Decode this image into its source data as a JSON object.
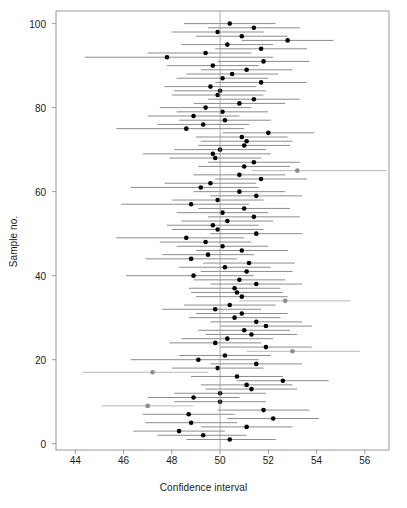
{
  "chart_data": {
    "type": "scatter",
    "title": "",
    "xlabel": "Confidence interval",
    "ylabel": "Sample no.",
    "xlim": [
      43.2,
      57.0
    ],
    "ylim": [
      -1.5,
      103
    ],
    "grid": false,
    "legend": null,
    "xticks": [
      44,
      46,
      48,
      50,
      52,
      54,
      56
    ],
    "yticks": [
      0,
      20,
      40,
      60,
      80,
      100
    ],
    "reference_line": {
      "x": 50,
      "orientation": "vertical",
      "color": "#999999"
    },
    "colors": {
      "covering": "#000000",
      "non_covering": "#8c8c8c",
      "interval_line": "#808080",
      "frame": "#999999"
    },
    "series": [
      {
        "name": "Confidence intervals",
        "x_label": "mean",
        "lo_label": "lower",
        "hi_label": "upper"
      }
    ],
    "points": [
      {
        "sample": 1,
        "mean": 50.4,
        "lo": 48.6,
        "hi": 52.3,
        "covers": true
      },
      {
        "sample": 2,
        "mean": 49.3,
        "lo": 47.4,
        "hi": 51.1,
        "covers": true
      },
      {
        "sample": 3,
        "mean": 48.3,
        "lo": 46.4,
        "hi": 50.2,
        "covers": true
      },
      {
        "sample": 4,
        "mean": 51.1,
        "lo": 49.2,
        "hi": 53.0,
        "covers": true
      },
      {
        "sample": 5,
        "mean": 48.8,
        "lo": 46.9,
        "hi": 50.7,
        "covers": true
      },
      {
        "sample": 6,
        "mean": 52.2,
        "lo": 50.3,
        "hi": 54.1,
        "covers": true
      },
      {
        "sample": 7,
        "mean": 48.7,
        "lo": 46.8,
        "hi": 50.6,
        "covers": true
      },
      {
        "sample": 8,
        "mean": 51.8,
        "lo": 49.9,
        "hi": 53.7,
        "covers": true
      },
      {
        "sample": 9,
        "mean": 47.0,
        "lo": 45.1,
        "hi": 48.9,
        "covers": false
      },
      {
        "sample": 10,
        "mean": 50.0,
        "lo": 48.1,
        "hi": 51.9,
        "covers": true
      },
      {
        "sample": 11,
        "mean": 48.9,
        "lo": 47.0,
        "hi": 50.8,
        "covers": true
      },
      {
        "sample": 12,
        "mean": 50.0,
        "lo": 48.1,
        "hi": 51.9,
        "covers": true
      },
      {
        "sample": 13,
        "mean": 51.3,
        "lo": 49.4,
        "hi": 53.2,
        "covers": true
      },
      {
        "sample": 14,
        "mean": 51.1,
        "lo": 49.2,
        "hi": 53.0,
        "covers": true
      },
      {
        "sample": 15,
        "mean": 52.6,
        "lo": 50.7,
        "hi": 54.5,
        "covers": true
      },
      {
        "sample": 16,
        "mean": 50.7,
        "lo": 48.8,
        "hi": 52.6,
        "covers": true
      },
      {
        "sample": 17,
        "mean": 47.2,
        "lo": 44.3,
        "hi": 49.5,
        "covers": false
      },
      {
        "sample": 18,
        "mean": 49.9,
        "lo": 48.0,
        "hi": 51.8,
        "covers": true
      },
      {
        "sample": 19,
        "mean": 51.5,
        "lo": 49.6,
        "hi": 53.4,
        "covers": true
      },
      {
        "sample": 20,
        "mean": 49.1,
        "lo": 46.3,
        "hi": 51.6,
        "covers": true
      },
      {
        "sample": 21,
        "mean": 50.2,
        "lo": 48.3,
        "hi": 52.1,
        "covers": true
      },
      {
        "sample": 22,
        "mean": 53.0,
        "lo": 51.1,
        "hi": 55.8,
        "covers": false
      },
      {
        "sample": 23,
        "mean": 51.9,
        "lo": 50.0,
        "hi": 53.8,
        "covers": true
      },
      {
        "sample": 24,
        "mean": 49.8,
        "lo": 47.9,
        "hi": 51.7,
        "covers": true
      },
      {
        "sample": 25,
        "mean": 50.3,
        "lo": 48.4,
        "hi": 52.2,
        "covers": true
      },
      {
        "sample": 26,
        "mean": 51.3,
        "lo": 49.4,
        "hi": 53.2,
        "covers": true
      },
      {
        "sample": 27,
        "mean": 51.0,
        "lo": 49.1,
        "hi": 52.9,
        "covers": true
      },
      {
        "sample": 28,
        "mean": 51.9,
        "lo": 50.0,
        "hi": 53.8,
        "covers": true
      },
      {
        "sample": 29,
        "mean": 51.5,
        "lo": 49.6,
        "hi": 53.4,
        "covers": true
      },
      {
        "sample": 30,
        "mean": 50.6,
        "lo": 48.7,
        "hi": 52.5,
        "covers": true
      },
      {
        "sample": 31,
        "mean": 50.9,
        "lo": 49.0,
        "hi": 52.8,
        "covers": true
      },
      {
        "sample": 32,
        "mean": 49.8,
        "lo": 47.6,
        "hi": 51.7,
        "covers": true
      },
      {
        "sample": 33,
        "mean": 50.4,
        "lo": 48.5,
        "hi": 52.3,
        "covers": true
      },
      {
        "sample": 34,
        "mean": 52.7,
        "lo": 50.8,
        "hi": 55.4,
        "covers": false
      },
      {
        "sample": 35,
        "mean": 50.9,
        "lo": 49.0,
        "hi": 52.8,
        "covers": true
      },
      {
        "sample": 36,
        "mean": 50.7,
        "lo": 48.8,
        "hi": 52.6,
        "covers": true
      },
      {
        "sample": 37,
        "mean": 50.6,
        "lo": 48.7,
        "hi": 52.5,
        "covers": true
      },
      {
        "sample": 38,
        "mean": 51.5,
        "lo": 49.6,
        "hi": 53.4,
        "covers": true
      },
      {
        "sample": 39,
        "mean": 50.8,
        "lo": 48.9,
        "hi": 52.7,
        "covers": true
      },
      {
        "sample": 40,
        "mean": 48.9,
        "lo": 46.1,
        "hi": 51.4,
        "covers": true
      },
      {
        "sample": 41,
        "mean": 51.1,
        "lo": 49.2,
        "hi": 53.0,
        "covers": true
      },
      {
        "sample": 42,
        "mean": 50.2,
        "lo": 48.3,
        "hi": 52.1,
        "covers": true
      },
      {
        "sample": 43,
        "mean": 51.2,
        "lo": 49.3,
        "hi": 53.1,
        "covers": true
      },
      {
        "sample": 44,
        "mean": 48.8,
        "lo": 46.9,
        "hi": 50.7,
        "covers": true
      },
      {
        "sample": 45,
        "mean": 49.5,
        "lo": 47.6,
        "hi": 51.4,
        "covers": true
      },
      {
        "sample": 46,
        "mean": 50.9,
        "lo": 49.0,
        "hi": 52.8,
        "covers": true
      },
      {
        "sample": 47,
        "mean": 50.1,
        "lo": 48.2,
        "hi": 52.0,
        "covers": true
      },
      {
        "sample": 48,
        "mean": 49.4,
        "lo": 47.5,
        "hi": 51.3,
        "covers": true
      },
      {
        "sample": 49,
        "mean": 48.6,
        "lo": 45.7,
        "hi": 51.0,
        "covers": true
      },
      {
        "sample": 50,
        "mean": 51.5,
        "lo": 49.6,
        "hi": 53.4,
        "covers": true
      },
      {
        "sample": 51,
        "mean": 49.9,
        "lo": 48.0,
        "hi": 51.8,
        "covers": true
      },
      {
        "sample": 52,
        "mean": 49.7,
        "lo": 47.8,
        "hi": 51.6,
        "covers": true
      },
      {
        "sample": 53,
        "mean": 50.3,
        "lo": 48.4,
        "hi": 52.2,
        "covers": true
      },
      {
        "sample": 54,
        "mean": 51.4,
        "lo": 49.5,
        "hi": 53.3,
        "covers": true
      },
      {
        "sample": 55,
        "mean": 50.1,
        "lo": 48.2,
        "hi": 52.0,
        "covers": true
      },
      {
        "sample": 56,
        "mean": 51.0,
        "lo": 49.1,
        "hi": 52.9,
        "covers": true
      },
      {
        "sample": 57,
        "mean": 48.8,
        "lo": 45.9,
        "hi": 51.2,
        "covers": true
      },
      {
        "sample": 58,
        "mean": 49.9,
        "lo": 48.0,
        "hi": 51.8,
        "covers": true
      },
      {
        "sample": 59,
        "mean": 51.5,
        "lo": 49.6,
        "hi": 53.4,
        "covers": true
      },
      {
        "sample": 60,
        "mean": 50.8,
        "lo": 48.9,
        "hi": 52.7,
        "covers": true
      },
      {
        "sample": 61,
        "mean": 49.2,
        "lo": 46.3,
        "hi": 51.6,
        "covers": true
      },
      {
        "sample": 62,
        "mean": 49.6,
        "lo": 47.7,
        "hi": 51.5,
        "covers": true
      },
      {
        "sample": 63,
        "mean": 51.7,
        "lo": 49.8,
        "hi": 53.6,
        "covers": true
      },
      {
        "sample": 64,
        "mean": 50.8,
        "lo": 48.9,
        "hi": 52.7,
        "covers": true
      },
      {
        "sample": 65,
        "mean": 53.2,
        "lo": 51.3,
        "hi": 56.9,
        "covers": false
      },
      {
        "sample": 66,
        "mean": 51.0,
        "lo": 49.1,
        "hi": 52.9,
        "covers": true
      },
      {
        "sample": 67,
        "mean": 51.4,
        "lo": 49.5,
        "hi": 53.3,
        "covers": true
      },
      {
        "sample": 68,
        "mean": 49.8,
        "lo": 47.9,
        "hi": 51.7,
        "covers": true
      },
      {
        "sample": 69,
        "mean": 49.7,
        "lo": 46.8,
        "hi": 52.1,
        "covers": true
      },
      {
        "sample": 70,
        "mean": 50.0,
        "lo": 48.1,
        "hi": 51.9,
        "covers": true
      },
      {
        "sample": 71,
        "mean": 51.0,
        "lo": 49.1,
        "hi": 52.9,
        "covers": true
      },
      {
        "sample": 72,
        "mean": 51.1,
        "lo": 49.2,
        "hi": 53.0,
        "covers": true
      },
      {
        "sample": 73,
        "mean": 50.9,
        "lo": 49.0,
        "hi": 52.8,
        "covers": true
      },
      {
        "sample": 74,
        "mean": 52.0,
        "lo": 50.1,
        "hi": 53.9,
        "covers": true
      },
      {
        "sample": 75,
        "mean": 48.6,
        "lo": 45.7,
        "hi": 51.0,
        "covers": true
      },
      {
        "sample": 76,
        "mean": 49.3,
        "lo": 47.4,
        "hi": 51.2,
        "covers": true
      },
      {
        "sample": 77,
        "mean": 50.2,
        "lo": 48.3,
        "hi": 52.1,
        "covers": true
      },
      {
        "sample": 78,
        "mean": 48.9,
        "lo": 47.0,
        "hi": 50.8,
        "covers": true
      },
      {
        "sample": 79,
        "mean": 50.1,
        "lo": 48.2,
        "hi": 52.0,
        "covers": true
      },
      {
        "sample": 80,
        "mean": 49.4,
        "lo": 47.5,
        "hi": 51.3,
        "covers": true
      },
      {
        "sample": 81,
        "mean": 50.8,
        "lo": 48.9,
        "hi": 52.7,
        "covers": true
      },
      {
        "sample": 82,
        "mean": 51.4,
        "lo": 49.5,
        "hi": 53.3,
        "covers": true
      },
      {
        "sample": 83,
        "mean": 49.9,
        "lo": 48.0,
        "hi": 51.8,
        "covers": true
      },
      {
        "sample": 84,
        "mean": 50.0,
        "lo": 48.1,
        "hi": 51.9,
        "covers": true
      },
      {
        "sample": 85,
        "mean": 49.6,
        "lo": 47.7,
        "hi": 51.5,
        "covers": true
      },
      {
        "sample": 86,
        "mean": 51.7,
        "lo": 49.8,
        "hi": 53.6,
        "covers": true
      },
      {
        "sample": 87,
        "mean": 50.1,
        "lo": 48.2,
        "hi": 52.0,
        "covers": true
      },
      {
        "sample": 88,
        "mean": 50.5,
        "lo": 48.6,
        "hi": 52.4,
        "covers": true
      },
      {
        "sample": 89,
        "mean": 51.1,
        "lo": 49.2,
        "hi": 53.0,
        "covers": true
      },
      {
        "sample": 90,
        "mean": 49.7,
        "lo": 47.8,
        "hi": 51.6,
        "covers": true
      },
      {
        "sample": 91,
        "mean": 51.8,
        "lo": 49.9,
        "hi": 53.7,
        "covers": true
      },
      {
        "sample": 92,
        "mean": 47.8,
        "lo": 44.4,
        "hi": 52.2,
        "covers": true
      },
      {
        "sample": 93,
        "mean": 49.4,
        "lo": 47.0,
        "hi": 51.3,
        "covers": true
      },
      {
        "sample": 94,
        "mean": 51.7,
        "lo": 49.8,
        "hi": 53.6,
        "covers": true
      },
      {
        "sample": 95,
        "mean": 50.3,
        "lo": 48.4,
        "hi": 52.2,
        "covers": true
      },
      {
        "sample": 96,
        "mean": 52.8,
        "lo": 50.9,
        "hi": 54.7,
        "covers": true
      },
      {
        "sample": 97,
        "mean": 50.9,
        "lo": 49.0,
        "hi": 52.8,
        "covers": true
      },
      {
        "sample": 98,
        "mean": 49.9,
        "lo": 48.0,
        "hi": 51.8,
        "covers": true
      },
      {
        "sample": 99,
        "mean": 51.4,
        "lo": 49.5,
        "hi": 53.3,
        "covers": true
      },
      {
        "sample": 100,
        "mean": 50.4,
        "lo": 48.5,
        "hi": 52.3,
        "covers": true
      }
    ]
  }
}
